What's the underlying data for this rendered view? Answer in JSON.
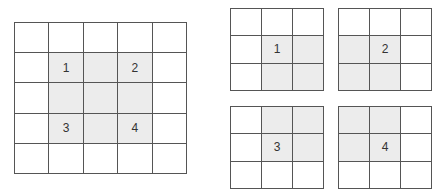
{
  "colors": {
    "line": "#555555",
    "shaded": "#ececec",
    "background": "#ffffff",
    "label": "#333333"
  },
  "big_grid": {
    "rows": 5,
    "cols": 5,
    "shaded": [
      [
        1,
        1
      ],
      [
        1,
        2
      ],
      [
        1,
        3
      ],
      [
        2,
        1
      ],
      [
        2,
        2
      ],
      [
        2,
        3
      ],
      [
        3,
        1
      ],
      [
        3,
        2
      ],
      [
        3,
        3
      ]
    ],
    "labels": [
      {
        "row": 1,
        "col": 1,
        "text": "1"
      },
      {
        "row": 1,
        "col": 3,
        "text": "2"
      },
      {
        "row": 3,
        "col": 1,
        "text": "3"
      },
      {
        "row": 3,
        "col": 3,
        "text": "4"
      }
    ]
  },
  "small_grids": [
    {
      "id": "g1",
      "rows": 3,
      "cols": 3,
      "shaded": [
        [
          1,
          1
        ],
        [
          1,
          2
        ],
        [
          2,
          1
        ],
        [
          2,
          2
        ]
      ],
      "label": {
        "row": 1,
        "col": 1,
        "text": "1"
      }
    },
    {
      "id": "g2",
      "rows": 3,
      "cols": 3,
      "shaded": [
        [
          1,
          0
        ],
        [
          1,
          1
        ],
        [
          2,
          0
        ],
        [
          2,
          1
        ]
      ],
      "label": {
        "row": 1,
        "col": 1,
        "text": "2"
      }
    },
    {
      "id": "g3",
      "rows": 3,
      "cols": 3,
      "shaded": [
        [
          0,
          1
        ],
        [
          0,
          2
        ],
        [
          1,
          1
        ],
        [
          1,
          2
        ]
      ],
      "label": {
        "row": 1,
        "col": 1,
        "text": "3"
      }
    },
    {
      "id": "g4",
      "rows": 3,
      "cols": 3,
      "shaded": [
        [
          0,
          0
        ],
        [
          0,
          1
        ],
        [
          1,
          0
        ],
        [
          1,
          1
        ]
      ],
      "label": {
        "row": 1,
        "col": 1,
        "text": "4"
      }
    }
  ]
}
